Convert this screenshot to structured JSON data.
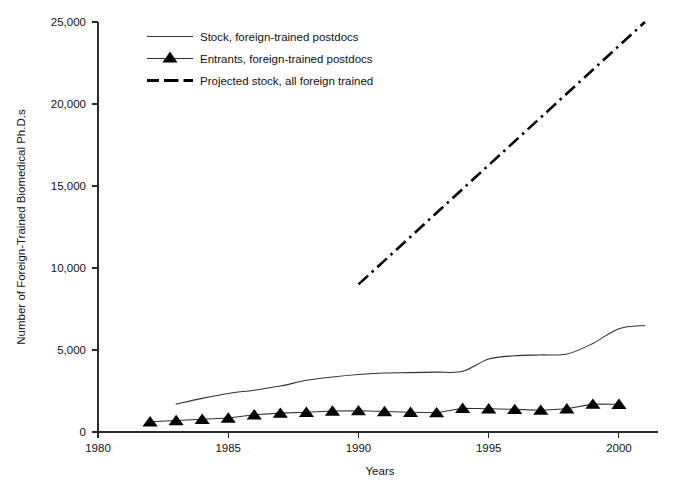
{
  "chart_data": {
    "type": "line",
    "title": "",
    "xlabel": "Years",
    "ylabel": "Number of Foreign-Trained Biomedical Ph.D.s",
    "xlim": [
      1980,
      2001.5
    ],
    "ylim": [
      0,
      25000
    ],
    "grid": false,
    "legend_position": "top-left-inside",
    "xticks": [
      1980,
      1985,
      1990,
      1995,
      2000
    ],
    "xticklabels": [
      "1980",
      "1985",
      "1990",
      "1995",
      "2000"
    ],
    "yticks": [
      0,
      5000,
      10000,
      15000,
      20000,
      25000
    ],
    "yticklabels": [
      "0",
      "5,000",
      "10,000",
      "15,000",
      "20,000",
      "25,000"
    ],
    "series": [
      {
        "name": "Stock, foreign-trained postdocs",
        "marker": "none",
        "style": "solid-thin",
        "x": [
          1983,
          1984,
          1985,
          1986,
          1987,
          1988,
          1989,
          1990,
          1991,
          1992,
          1993,
          1994,
          1995,
          1996,
          1997,
          1998,
          1999,
          2000,
          2001
        ],
        "values": [
          1700,
          2050,
          2350,
          2550,
          2800,
          3150,
          3350,
          3500,
          3600,
          3620,
          3650,
          3700,
          4450,
          4650,
          4700,
          4750,
          5400,
          6300,
          6500
        ]
      },
      {
        "name": "Entrants, foreign-trained postdocs",
        "marker": "triangle",
        "style": "solid-thin-with-markers",
        "x": [
          1982,
          1983,
          1984,
          1985,
          1986,
          1987,
          1988,
          1989,
          1990,
          1991,
          1992,
          1993,
          1994,
          1995,
          1996,
          1997,
          1998,
          1999,
          2000
        ],
        "values": [
          620,
          700,
          780,
          850,
          1050,
          1150,
          1200,
          1280,
          1300,
          1250,
          1200,
          1180,
          1450,
          1420,
          1380,
          1330,
          1420,
          1700,
          1690
        ]
      },
      {
        "name": "Projected stock, all foreign trained",
        "marker": "none",
        "style": "dash-dot-thick",
        "x": [
          1990,
          2001
        ],
        "values": [
          9000,
          25000
        ]
      }
    ]
  },
  "legend": {
    "entries": [
      {
        "label": "Stock, foreign-trained postdocs",
        "style": "solid-thin"
      },
      {
        "label": "Entrants, foreign-trained postdocs",
        "style": "solid-thin-triangle"
      },
      {
        "label": "Projected stock, all foreign trained",
        "style": "dash-dot-thick"
      }
    ]
  }
}
